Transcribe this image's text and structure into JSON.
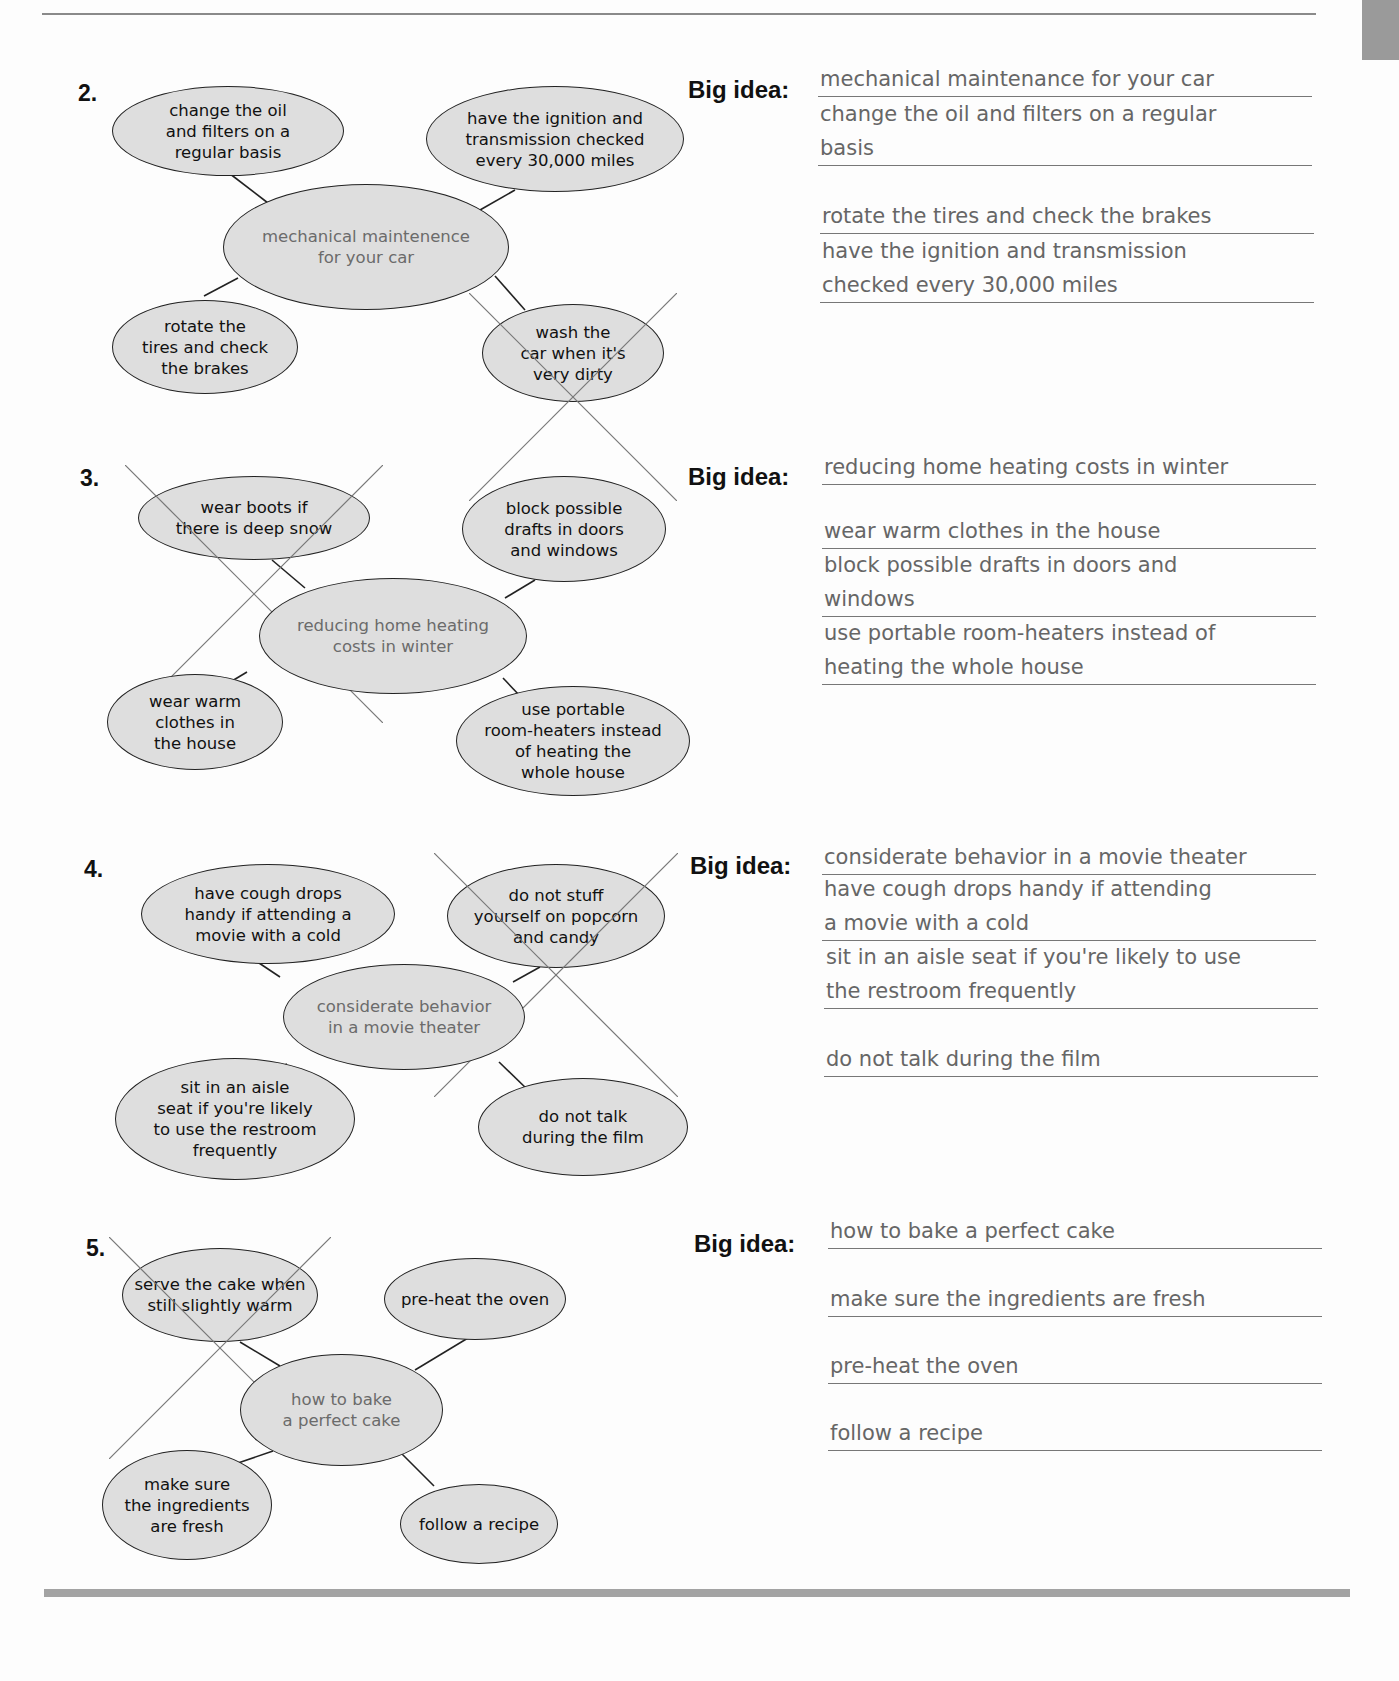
{
  "page": {
    "colors": {
      "bubble_fill": "#dedede",
      "center_text": "#6b6b6b",
      "answer_text": "#666666",
      "rule": "#a3a3a3"
    }
  },
  "big_idea_label": "Big idea:",
  "exercises": [
    {
      "number": "2.",
      "center": "mechanical maintenence\nfor your car",
      "bubbles": [
        {
          "text": "change the oil\nand filters on a\nregular basis",
          "crossed": false
        },
        {
          "text": "have the ignition and\ntransmission checked\nevery 30,000 miles",
          "crossed": false
        },
        {
          "text": "rotate the\ntires and check\nthe brakes",
          "crossed": false
        },
        {
          "text": "wash the\ncar when it's\nvery dirty",
          "crossed": true
        }
      ],
      "big_idea": "mechanical maintenance for your car",
      "answers": [
        "change the oil and filters on a regular\nbasis",
        "rotate the tires and check the brakes",
        "have the ignition and transmission\nchecked every 30,000 miles"
      ]
    },
    {
      "number": "3.",
      "center": "reducing home heating\ncosts in winter",
      "bubbles": [
        {
          "text": "wear boots if\nthere is deep snow",
          "crossed": true
        },
        {
          "text": "block possible\ndrafts in doors\nand windows",
          "crossed": false
        },
        {
          "text": "wear warm\nclothes in\nthe house",
          "crossed": false
        },
        {
          "text": "use portable\nroom-heaters instead\nof heating the\nwhole house",
          "crossed": false
        }
      ],
      "big_idea": "reducing home heating costs in winter",
      "answers": [
        "wear warm clothes in the house",
        "block possible drafts in doors and\nwindows",
        "use portable room-heaters instead of\nheating the whole house"
      ]
    },
    {
      "number": "4.",
      "center": "considerate behavior\nin a movie theater",
      "bubbles": [
        {
          "text": "have cough drops\nhandy if attending a\nmovie with a cold",
          "crossed": false
        },
        {
          "text": "do not stuff\nyourself on popcorn\nand candy",
          "crossed": true
        },
        {
          "text": "sit in an aisle\nseat if you're likely\nto use the restroom\nfrequently",
          "crossed": false
        },
        {
          "text": "do not talk\nduring the film",
          "crossed": false
        }
      ],
      "big_idea": "considerate behavior in a movie theater",
      "answers": [
        "have cough drops handy if attending\na movie with a cold",
        "sit in an aisle seat if you're likely to use\nthe restroom frequently",
        "do not talk during the film"
      ]
    },
    {
      "number": "5.",
      "center": "how to bake\na perfect cake",
      "bubbles": [
        {
          "text": "serve the cake when\nstill slightly warm",
          "crossed": true
        },
        {
          "text": "pre-heat the oven",
          "crossed": false
        },
        {
          "text": "make sure\nthe ingredients\nare fresh",
          "crossed": false
        },
        {
          "text": "follow a recipe",
          "crossed": false
        }
      ],
      "big_idea": "how to bake a perfect cake",
      "answers": [
        "make sure the ingredients are fresh",
        "pre-heat the oven",
        "follow a recipe"
      ]
    }
  ]
}
